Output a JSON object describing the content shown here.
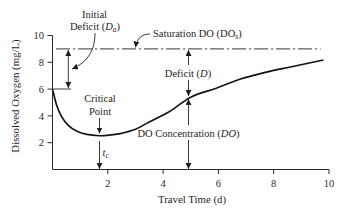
{
  "figure": {
    "background": "#ffffff",
    "line_color": "#141414"
  },
  "labels": {
    "initial_deficit": {
      "line1": "Initial",
      "prefix": "Deficit (",
      "symbol": "D",
      "subscript": "a",
      "suffix": ")"
    },
    "saturation": {
      "prefix": "Saturation DO (DO",
      "subscript": "s",
      "suffix": ")"
    },
    "deficit": {
      "prefix": "Deficit (",
      "symbol": "D",
      "suffix": ")"
    },
    "critical_point": {
      "line1": "Critical",
      "line2": "Point"
    },
    "do_concentration": {
      "prefix": "DO Concentration (",
      "symbol": "DO",
      "suffix": ")"
    },
    "critical_time": {
      "symbol": "t",
      "subscript": "c"
    }
  },
  "chart_data": {
    "type": "line",
    "title": "",
    "xlabel": "Travel Time (d)",
    "ylabel": "Dissolved Oxygen (mg/L)",
    "xlim": [
      0,
      10
    ],
    "ylim": [
      0,
      10
    ],
    "xticks": [
      2,
      4,
      6,
      8,
      10
    ],
    "yticks": [
      2,
      4,
      6,
      8,
      10
    ],
    "grid": false,
    "legend": null,
    "series": [
      {
        "name": "DO Concentration (DO)",
        "style": "solid",
        "x": [
          0,
          0.15,
          0.33,
          0.57,
          0.87,
          1.24,
          1.7,
          2.0,
          2.45,
          3.0,
          3.5,
          4.25,
          5.0,
          5.9,
          6.8,
          7.7,
          8.6,
          9.8
        ],
        "y": [
          6.0,
          4.8,
          3.95,
          3.3,
          2.87,
          2.62,
          2.52,
          2.55,
          2.68,
          3.0,
          3.55,
          4.35,
          5.4,
          6.05,
          6.75,
          7.25,
          7.65,
          8.17
        ]
      },
      {
        "name": "Saturation DO (DOs)",
        "style": "dash-dot",
        "x": [
          0.13,
          9.7
        ],
        "y": [
          9,
          9
        ]
      }
    ],
    "annotations": [
      {
        "text": "Initial Deficit (Da)",
        "x": 0.57,
        "from_y": 6,
        "to_y": 9,
        "value": 3
      },
      {
        "text": "Saturation DO (DOs)",
        "value": 9
      },
      {
        "text": "Deficit (D)",
        "x": 4.9,
        "from_y": 5.4,
        "to_y": 9
      },
      {
        "text": "DO Concentration (DO)",
        "x": 4.9,
        "from_y": 0,
        "to_y": 5.4
      },
      {
        "text": "Critical Point",
        "x": 1.7,
        "y": 2.52
      },
      {
        "text": "tc",
        "x": 1.7
      }
    ]
  }
}
